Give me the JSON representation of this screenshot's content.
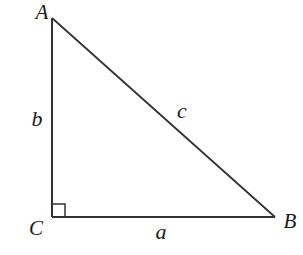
{
  "diagram": {
    "type": "right-triangle",
    "stroke_color": "#333333",
    "vertices": {
      "A": {
        "label": "A",
        "x": 52,
        "y": 18
      },
      "B": {
        "label": "B",
        "x": 275,
        "y": 217
      },
      "C": {
        "label": "C",
        "x": 52,
        "y": 217
      }
    },
    "sides": {
      "a": {
        "label": "a",
        "between": "C-B"
      },
      "b": {
        "label": "b",
        "between": "A-C"
      },
      "c": {
        "label": "c",
        "between": "A-B"
      }
    },
    "right_angle_at": "C"
  }
}
